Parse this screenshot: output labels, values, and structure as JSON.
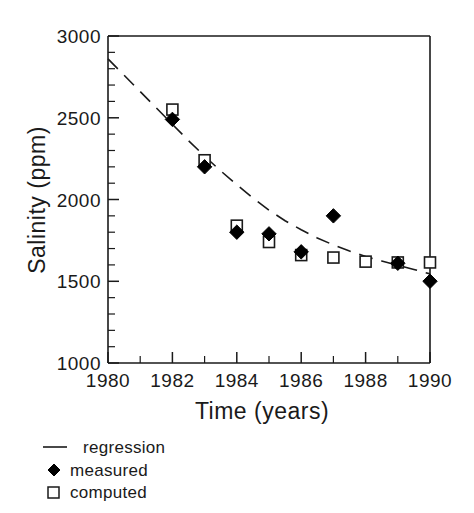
{
  "chart_data": {
    "type": "scatter",
    "title": "",
    "xlabel": "Time  (years)",
    "ylabel": "Salinity  (ppm)",
    "xlim": [
      1980,
      1990
    ],
    "ylim": [
      1000,
      3000
    ],
    "xticks": [
      1980,
      1982,
      1984,
      1986,
      1988,
      1990
    ],
    "xtick_labels": [
      "1980",
      "1982",
      "1984",
      "1986",
      "1988",
      "1990"
    ],
    "xminor_ticks": [
      1981,
      1983,
      1985,
      1987,
      1989
    ],
    "yticks": [
      1000,
      1500,
      2000,
      2500,
      3000
    ],
    "ytick_labels": [
      "1000",
      "1500",
      "2000",
      "2500",
      "3000"
    ],
    "yminor_ticks": [
      1100,
      1200,
      1300,
      1400,
      1600,
      1700,
      1800,
      1900,
      2100,
      2200,
      2300,
      2400,
      2600,
      2700,
      2800,
      2900
    ],
    "grid": false,
    "legend_position": "below-axes-left",
    "series": [
      {
        "name": "regression",
        "type": "line",
        "style": "dashed",
        "color": "#1a1a1a",
        "x": [
          1980.0,
          1980.5,
          1981.0,
          1981.5,
          1982.0,
          1982.5,
          1983.0,
          1983.5,
          1984.0,
          1984.5,
          1985.0,
          1985.5,
          1986.0,
          1986.5,
          1987.0,
          1987.5,
          1988.0,
          1988.5,
          1989.0,
          1989.5,
          1990.0
        ],
        "y": [
          2860,
          2760,
          2660,
          2560,
          2460,
          2360,
          2265,
          2175,
          2090,
          2010,
          1935,
          1870,
          1815,
          1765,
          1722,
          1685,
          1652,
          1624,
          1598,
          1572,
          1545
        ]
      },
      {
        "name": "measured",
        "type": "scatter",
        "marker": "filled-diamond",
        "color": "#000000",
        "x": [
          1982,
          1983,
          1984,
          1985,
          1986,
          1987,
          1989,
          1990
        ],
        "y": [
          2490,
          2200,
          1800,
          1790,
          1680,
          1900,
          1610,
          1500
        ]
      },
      {
        "name": "computed",
        "type": "scatter",
        "marker": "open-square",
        "color": "#000000",
        "x": [
          1982,
          1983,
          1984,
          1985,
          1986,
          1987,
          1988,
          1989,
          1990
        ],
        "y": [
          2550,
          2240,
          1840,
          1740,
          1660,
          1645,
          1620,
          1615,
          1615
        ]
      }
    ],
    "legend": [
      {
        "label": "regression",
        "marker": "line-dash"
      },
      {
        "label": "measured",
        "marker": "filled-diamond"
      },
      {
        "label": "computed",
        "marker": "open-square"
      }
    ]
  }
}
